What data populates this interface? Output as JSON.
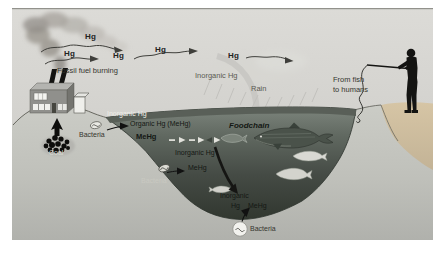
{
  "diagram": {
    "atmosphere": {
      "hg_flow_labels": [
        "Hg",
        "Hg",
        "Hg",
        "Hg",
        "Hg"
      ],
      "fossil_fuel_burning": "Fossil fuel burning",
      "inorganic_hg": "Inorganic Hg",
      "rain": "Rain"
    },
    "land": {
      "coal": "Coal",
      "from_fish_line1": "From fish",
      "from_fish_line2": "to humans"
    },
    "water": {
      "surface_layer_inorganic_hg": "Inorganic Hg",
      "surface_bacteria": "Bacteria",
      "organic_hg": "Organic Hg (MeHg)",
      "surface_mehg": "MeHg",
      "foodchain": "Foodchain",
      "mid_inorganic_hg": "Inorganic Hg",
      "mid_mehg": "MeHg",
      "mid_bacteria": "Bacteria",
      "deep_inorganic_line1": "Inorganic",
      "deep_inorganic_line2": "Hg",
      "deep_mehg": "MeHg",
      "deep_bacteria": "Bacteria"
    },
    "colors": {
      "sky": "#d8d7d3",
      "land": "#c7c8c2",
      "water_shallow": "#7d857d",
      "water_deep": "#31372f",
      "surface_band": "#575e56",
      "rock": "#d4c3a3",
      "smoke": "#a19d97",
      "silhouette": "#141412"
    }
  }
}
